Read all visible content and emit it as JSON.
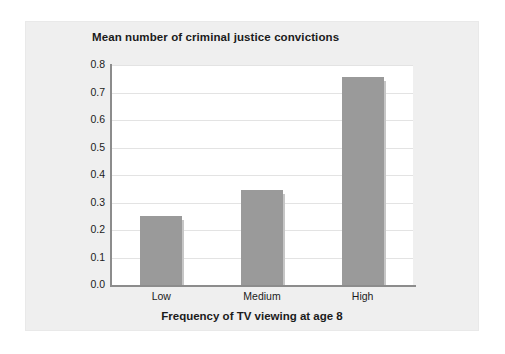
{
  "figure": {
    "background_color": "#ffffff",
    "panel_color": "#efefef",
    "plot_background_color": "#ffffff"
  },
  "chart_data": {
    "type": "bar",
    "title": "Mean number of criminal justice convictions",
    "xlabel": "Frequency of TV viewing at age 8",
    "ylabel": "",
    "categories": [
      "Low",
      "Medium",
      "High"
    ],
    "values": [
      0.25,
      0.345,
      0.755
    ],
    "ylim": [
      0.0,
      0.8
    ],
    "ytick_step": 0.1,
    "ytick_labels": [
      "0.0",
      "0.1",
      "0.2",
      "0.3",
      "0.4",
      "0.5",
      "0.6",
      "0.7",
      "0.8"
    ],
    "ytick_values": [
      0.0,
      0.1,
      0.2,
      0.3,
      0.4,
      0.5,
      0.6,
      0.7,
      0.8
    ],
    "grid": true,
    "grid_axis": "y",
    "grid_color": "#e3e3e3",
    "legend": false,
    "bar_color": "#9a9a9a",
    "bar_shadow_color": "#c6c6c6",
    "axis_line_color": "#8c8c8c",
    "text_color": "#1b1b1b"
  }
}
